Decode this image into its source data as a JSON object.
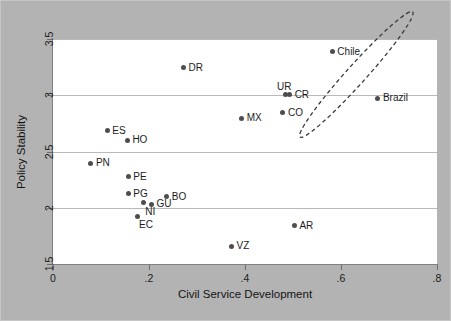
{
  "chart_data": {
    "type": "scatter",
    "title": "",
    "xlabel": "Civil Service Development",
    "ylabel": "Policy Stability",
    "xlim": [
      0,
      0.8
    ],
    "ylim": [
      1.5,
      3.5
    ],
    "xticks": [
      "0",
      ".2",
      ".4",
      ".6",
      ".8"
    ],
    "xtick_values": [
      0,
      0.2,
      0.4,
      0.6,
      0.8
    ],
    "yticks": [
      "1.5",
      "2",
      "2.5",
      "3",
      "3.5"
    ],
    "ytick_values": [
      1.5,
      2,
      2.5,
      3,
      3.5
    ],
    "grid": "horizontal",
    "legend": "none",
    "points": [
      {
        "label": "DR",
        "x": 0.272,
        "y": 3.245,
        "label_pos": "right"
      },
      {
        "label": "Chile",
        "x": 0.582,
        "y": 3.385,
        "label_pos": "right"
      },
      {
        "label": "UR",
        "x": 0.484,
        "y": 3.005,
        "label_pos": "above"
      },
      {
        "label": "CR",
        "x": 0.493,
        "y": 3.005,
        "label_pos": "right"
      },
      {
        "label": "Brazil",
        "x": 0.677,
        "y": 2.975,
        "label_pos": "right"
      },
      {
        "label": "CO",
        "x": 0.479,
        "y": 2.845,
        "label_pos": "right"
      },
      {
        "label": "MX",
        "x": 0.393,
        "y": 2.795,
        "label_pos": "right"
      },
      {
        "label": "ES",
        "x": 0.113,
        "y": 2.685,
        "label_pos": "right"
      },
      {
        "label": "HO",
        "x": 0.155,
        "y": 2.6,
        "label_pos": "right"
      },
      {
        "label": "PN",
        "x": 0.079,
        "y": 2.395,
        "label_pos": "right"
      },
      {
        "label": "PE",
        "x": 0.157,
        "y": 2.275,
        "label_pos": "right"
      },
      {
        "label": "PG",
        "x": 0.157,
        "y": 2.125,
        "label_pos": "right"
      },
      {
        "label": "BO",
        "x": 0.237,
        "y": 2.1,
        "label_pos": "right"
      },
      {
        "label": "GU",
        "x": 0.205,
        "y": 2.03,
        "label_pos": "right"
      },
      {
        "label": "NI",
        "x": 0.188,
        "y": 2.045,
        "label_pos": "below-right"
      },
      {
        "label": "EC",
        "x": 0.175,
        "y": 1.925,
        "label_pos": "below-right"
      },
      {
        "label": "AR",
        "x": 0.503,
        "y": 1.84,
        "label_pos": "right"
      },
      {
        "label": "VZ",
        "x": 0.372,
        "y": 1.66,
        "label_pos": "right"
      }
    ],
    "annotations": [
      {
        "type": "ellipse",
        "name": "highlight-ellipse",
        "style": "dashed",
        "encloses": [
          "Chile",
          "Brazil"
        ],
        "center_x": 0.632,
        "center_y": 3.185,
        "rx": 0.09,
        "ry": 0.045,
        "rotation_deg": -48
      }
    ]
  },
  "colors": {
    "figure_background": "#b3b3b3",
    "plot_background": "#ffffff",
    "gridline": "#b9b9b9",
    "axis": "#808080",
    "marker": "#4d4d4d",
    "text": "#1c1c1c",
    "annotation": "#3a3a3a"
  }
}
